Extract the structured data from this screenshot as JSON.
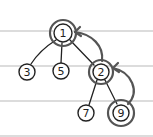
{
  "diagram": {
    "type": "tree",
    "paper": {
      "rule_lines_y": [
        31,
        66,
        101,
        136
      ],
      "rule_color": "#b9b9b9",
      "background": "#ffffff"
    },
    "nodes": [
      {
        "id": "n1",
        "label": "1",
        "x": 63,
        "y": 33,
        "r": 9,
        "highlighted": true
      },
      {
        "id": "n3",
        "label": "3",
        "x": 27,
        "y": 72,
        "r": 8,
        "highlighted": false
      },
      {
        "id": "n5",
        "label": "5",
        "x": 61,
        "y": 71,
        "r": 8,
        "highlighted": false
      },
      {
        "id": "n2",
        "label": "2",
        "x": 101,
        "y": 72,
        "r": 8,
        "highlighted": true
      },
      {
        "id": "n7",
        "label": "7",
        "x": 86,
        "y": 113,
        "r": 8,
        "highlighted": false
      },
      {
        "id": "n9",
        "label": "9",
        "x": 121,
        "y": 113,
        "r": 8,
        "highlighted": true
      }
    ],
    "edges": [
      {
        "from": "1",
        "to": "3"
      },
      {
        "from": "1",
        "to": "5"
      },
      {
        "from": "1",
        "to": "2"
      },
      {
        "from": "2",
        "to": "7"
      },
      {
        "from": "2",
        "to": "9"
      }
    ],
    "arrows": [
      {
        "from": "9",
        "to": "2",
        "style": "curved"
      },
      {
        "from": "2",
        "to": "1",
        "style": "curved"
      }
    ],
    "colors": {
      "ink": "#222222",
      "highlight": "#555555"
    }
  }
}
